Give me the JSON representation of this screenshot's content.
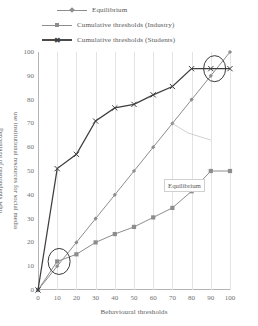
{
  "legend": {
    "items": [
      {
        "label": "Equilibrium",
        "marker": "diamond-marker",
        "color": "#8d8d8d"
      },
      {
        "label": "Cumulative thresholds (Industry)",
        "marker": "square-marker",
        "color": "#8d8d8d"
      },
      {
        "label": "Cumulative thresholds (Students)",
        "marker": "x-marker",
        "color": "#3f3f3f"
      }
    ]
  },
  "annotations": [
    {
      "name": "equilibrium-callout",
      "text": "Equilibrium"
    }
  ],
  "chart_data": {
    "type": "line",
    "title": "",
    "xlabel": "Behavioural thresholds",
    "ylabel": "Percentage of respondents who use institutional resources for social media",
    "ylabel_lines": [
      "Percentage of respondents who",
      "use institutional resources for social media"
    ],
    "xlim": [
      0,
      100
    ],
    "ylim": [
      0,
      100
    ],
    "xticks": [
      0,
      10,
      20,
      30,
      40,
      50,
      60,
      70,
      80,
      90,
      100
    ],
    "yticks": [
      0,
      10,
      20,
      30,
      40,
      50,
      60,
      70,
      80,
      90,
      100
    ],
    "grid": "vertical",
    "legend_position": "top",
    "x": [
      0,
      10,
      20,
      30,
      40,
      50,
      60,
      70,
      80,
      90,
      100
    ],
    "series": [
      {
        "name": "Equilibrium",
        "marker": "diamond",
        "color": "#8d8d8d",
        "values": [
          0,
          10,
          20,
          30,
          40,
          50,
          60,
          70,
          80,
          90,
          100
        ]
      },
      {
        "name": "Cumulative thresholds (Industry)",
        "marker": "square",
        "color": "#8d8d8d",
        "values": [
          0,
          12,
          15,
          20,
          23.5,
          26.5,
          30.5,
          34.5,
          41.5,
          50,
          50
        ]
      },
      {
        "name": "Cumulative thresholds (Students)",
        "marker": "x",
        "color": "#3f3f3f",
        "values": [
          0,
          51,
          57,
          71,
          76.5,
          78,
          82,
          85.5,
          93,
          93,
          93
        ]
      }
    ],
    "highlight_circles": [
      {
        "name": "lower-intersection-circle",
        "x": 11,
        "y": 12,
        "rx": 11,
        "ry": 13
      },
      {
        "name": "upper-intersection-circle",
        "x": 92,
        "y": 93,
        "rx": 11,
        "ry": 13
      }
    ]
  }
}
